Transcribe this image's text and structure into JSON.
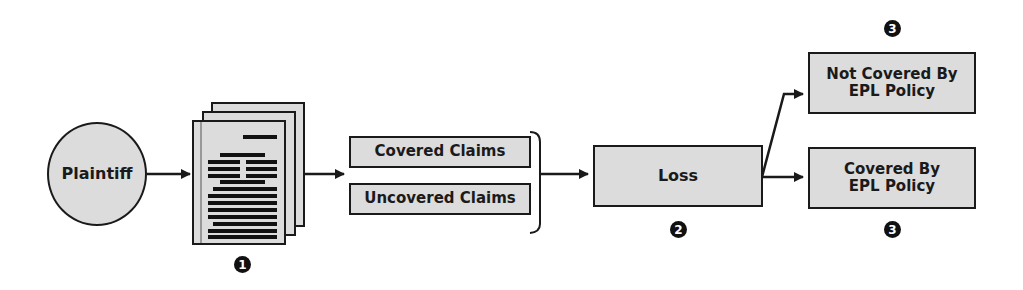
{
  "nodes": {
    "plaintiff": "Plaintiff",
    "covered_claims": "Covered Claims",
    "uncovered_claims": "Uncovered Claims",
    "loss": "Loss",
    "not_covered": "Not Covered By EPL Policy",
    "covered": "Covered By EPL Policy"
  },
  "markers": {
    "complaint": "1",
    "loss": "2",
    "not_covered": "3",
    "covered": "3"
  },
  "colors": {
    "fill": "#dcdcdc",
    "stroke": "#1a1a1a"
  }
}
